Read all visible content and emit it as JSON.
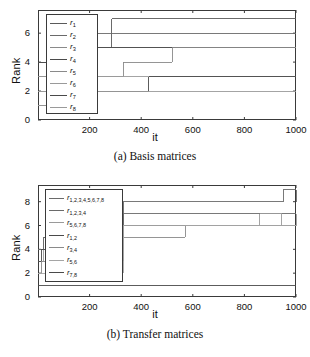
{
  "figure": {
    "width": 310,
    "height": 357,
    "background": "#ffffff",
    "line_color": "#555555",
    "axis_color": "#3a3a3a"
  },
  "panels": [
    {
      "id": "a",
      "caption": "(a) Basis matrices",
      "chart_key": 0
    },
    {
      "id": "b",
      "caption": "(b) Transfer matrices",
      "chart_key": 1
    }
  ],
  "chart_data": [
    {
      "type": "line",
      "step": true,
      "title": "(a) Basis matrices",
      "xlabel": "it",
      "ylabel": "Rank",
      "xlim": [
        0,
        1000
      ],
      "ylim": [
        0,
        7.6
      ],
      "xticks": [
        200,
        400,
        600,
        800,
        1000
      ],
      "yticks": [
        0,
        2,
        4,
        6
      ],
      "grid": false,
      "legend_position": "upper-left-inside",
      "series": [
        {
          "name": "r_1",
          "label_base": "r",
          "label_sub": "1",
          "color": "#5a5a5a",
          "x": [
            0,
            40,
            190,
            285,
            1000
          ],
          "y": [
            4,
            4,
            5,
            7,
            7
          ]
        },
        {
          "name": "r_2",
          "label_base": "r",
          "label_sub": "2",
          "color": "#6a6a6a",
          "x": [
            0,
            30,
            190,
            340,
            585,
            1000
          ],
          "y": [
            4,
            4,
            6,
            6,
            6,
            6
          ]
        },
        {
          "name": "r_3",
          "label_base": "r",
          "label_sub": "3",
          "color": "#8a8a8a",
          "x": [
            0,
            30,
            190,
            520,
            1000
          ],
          "y": [
            3,
            3,
            5,
            5,
            5
          ]
        },
        {
          "name": "r_4",
          "label_base": "r",
          "label_sub": "4",
          "color": "#4a4a4a",
          "x": [
            0,
            25,
            190,
            1000
          ],
          "y": [
            4,
            4,
            5,
            5
          ]
        },
        {
          "name": "r_5",
          "label_base": "r",
          "label_sub": "5",
          "color": "#8a8a8a",
          "x": [
            0,
            30,
            190,
            330,
            520,
            1000
          ],
          "y": [
            2,
            2,
            3,
            4,
            5,
            5
          ]
        },
        {
          "name": "r_6",
          "label_base": "r",
          "label_sub": "6",
          "color": "#9a9a9a",
          "x": [
            0,
            25,
            190,
            330,
            1000
          ],
          "y": [
            2,
            2,
            3,
            3,
            3
          ]
        },
        {
          "name": "r_7",
          "label_base": "r",
          "label_sub": "7",
          "color": "#4a4a4a",
          "x": [
            0,
            20,
            190,
            430,
            1000
          ],
          "y": [
            1,
            1,
            2,
            3,
            3
          ]
        },
        {
          "name": "r_8",
          "label_base": "r",
          "label_sub": "8",
          "color": "#9a9a9a",
          "x": [
            0,
            20,
            190,
            430,
            1000
          ],
          "y": [
            1,
            1,
            2,
            2,
            2
          ]
        }
      ]
    },
    {
      "type": "line",
      "step": true,
      "title": "(b) Transfer matrices",
      "xlabel": "it",
      "ylabel": "Rank",
      "xlim": [
        0,
        1000
      ],
      "ylim": [
        0,
        9.4
      ],
      "xticks": [
        200,
        400,
        600,
        800,
        1000
      ],
      "yticks": [
        0,
        2,
        4,
        6,
        8
      ],
      "grid": false,
      "legend_position": "upper-left-inside",
      "series": [
        {
          "name": "r_1,2,3,4,5,6,7,8",
          "label_base": "r",
          "label_sub": "1,2,3,4,5,6,7,8",
          "color": "#6a6a6a",
          "x": [
            0,
            20,
            330,
            940,
            950,
            1000
          ],
          "y": [
            4,
            5,
            8,
            8,
            9,
            8
          ]
        },
        {
          "name": "r_1,2,3,4",
          "label_base": "r",
          "label_sub": "1,2,3,4",
          "color": "#6a6a6a",
          "x": [
            0,
            20,
            330,
            445,
            1000
          ],
          "y": [
            4,
            5,
            7,
            7,
            7
          ]
        },
        {
          "name": "r_5,6,7,8",
          "label_base": "r",
          "label_sub": "5,6,7,8",
          "color": "#9a9a9a",
          "x": [
            0,
            20,
            330,
            860,
            945,
            1000
          ],
          "y": [
            3,
            4,
            6,
            7,
            6,
            7
          ]
        },
        {
          "name": "r_1,2",
          "label_base": "r",
          "label_sub": "1,2",
          "color": "#4a4a4a",
          "x": [
            0,
            15,
            330,
            1000
          ],
          "y": [
            3,
            4,
            6,
            6
          ]
        },
        {
          "name": "r_3,4",
          "label_base": "r",
          "label_sub": "3,4",
          "color": "#8a8a8a",
          "x": [
            0,
            15,
            330,
            445,
            570,
            1000
          ],
          "y": [
            2,
            3,
            5,
            5,
            6,
            6
          ]
        },
        {
          "name": "r_5,6",
          "label_base": "r",
          "label_sub": "5,6",
          "color": "#a5a5a5",
          "x": [
            0,
            15,
            330,
            1000
          ],
          "y": [
            2,
            2,
            6,
            6
          ]
        },
        {
          "name": "r_7,8",
          "label_base": "r",
          "label_sub": "7,8",
          "color": "#4a4a4a",
          "x": [
            0,
            1000
          ],
          "y": [
            1,
            1
          ]
        }
      ]
    }
  ]
}
